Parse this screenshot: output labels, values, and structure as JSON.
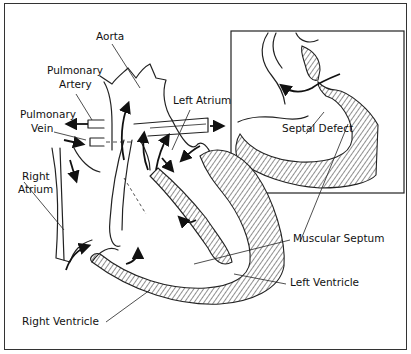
{
  "diagram": {
    "labels": {
      "aorta": "Aorta",
      "pulmonary_artery_line1": "Pulmonary",
      "pulmonary_artery_line2": "Artery",
      "pulmonary_vein_line1": "Pulmonary",
      "pulmonary_vein_line2": "Vein",
      "left_atrium": "Left Atrium",
      "right_atrium_line1": "Right",
      "right_atrium_line2": "Atrium",
      "septal_defect": "Septal Defect",
      "muscular_septum": "Muscular Septum",
      "left_ventricle": "Left Ventricle",
      "right_ventricle": "Right Ventricle"
    },
    "inset": "Magnified view of septal defect",
    "colors": {
      "line": "#222222",
      "background": "#ffffff"
    }
  }
}
